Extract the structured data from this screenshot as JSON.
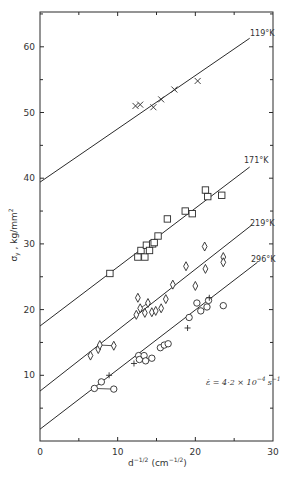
{
  "chart_data": {
    "type": "scatter",
    "title": "",
    "xlabel": "d^-1/2 (cm^-1/2)",
    "ylabel": "σy , kg/mm²",
    "xlim": [
      0,
      30
    ],
    "ylim": [
      0,
      66
    ],
    "x_ticks": [
      0,
      10,
      20,
      30
    ],
    "x_minor_ticks": [
      5,
      15,
      25
    ],
    "y_ticks": [
      10,
      20,
      30,
      40,
      50,
      60
    ],
    "y_minor_ticks": [
      5,
      15,
      25,
      35,
      45,
      55,
      65
    ],
    "grid": false,
    "annotation": "ε̇ = 4·2 × 10⁻⁴ s⁻¹",
    "series": [
      {
        "name": "119°K",
        "marker": "x",
        "fit_line": {
          "x": [
            0,
            27
          ],
          "y": [
            39.4,
            61.3
          ]
        },
        "points": [
          {
            "x": 12.3,
            "y": 51.0
          },
          {
            "x": 12.9,
            "y": 51.2
          },
          {
            "x": 14.6,
            "y": 50.8
          },
          {
            "x": 15.6,
            "y": 52.0
          },
          {
            "x": 17.3,
            "y": 53.5
          },
          {
            "x": 20.3,
            "y": 54.8
          }
        ]
      },
      {
        "name": "171°K",
        "marker": "square",
        "fit_line": {
          "x": [
            0,
            27
          ],
          "y": [
            17.5,
            41.7
          ]
        },
        "points": [
          {
            "x": 9.0,
            "y": 25.5
          },
          {
            "x": 12.6,
            "y": 28.0
          },
          {
            "x": 13.0,
            "y": 29.0
          },
          {
            "x": 13.5,
            "y": 28.0
          },
          {
            "x": 13.7,
            "y": 29.8
          },
          {
            "x": 14.1,
            "y": 29.0
          },
          {
            "x": 14.5,
            "y": 30.0
          },
          {
            "x": 14.7,
            "y": 30.2
          },
          {
            "x": 15.2,
            "y": 31.2
          },
          {
            "x": 16.4,
            "y": 33.8
          },
          {
            "x": 18.7,
            "y": 35.0
          },
          {
            "x": 19.6,
            "y": 34.6
          },
          {
            "x": 21.3,
            "y": 38.2
          },
          {
            "x": 21.6,
            "y": 37.2
          },
          {
            "x": 23.4,
            "y": 37.4
          }
        ]
      },
      {
        "name": "219°K",
        "marker": "diamond",
        "fit_line": {
          "x": [
            0,
            27.3
          ],
          "y": [
            7.6,
            32.9
          ]
        },
        "points": [
          {
            "x": 6.5,
            "y": 13.0
          },
          {
            "x": 7.5,
            "y": 14.0
          },
          {
            "x": 7.7,
            "y": 14.6
          },
          {
            "x": 9.5,
            "y": 14.5
          },
          {
            "x": 12.4,
            "y": 19.2
          },
          {
            "x": 12.6,
            "y": 21.8
          },
          {
            "x": 12.9,
            "y": 20.2
          },
          {
            "x": 13.5,
            "y": 19.5
          },
          {
            "x": 13.9,
            "y": 21.0
          },
          {
            "x": 14.4,
            "y": 19.6
          },
          {
            "x": 14.9,
            "y": 19.8
          },
          {
            "x": 15.6,
            "y": 20.2
          },
          {
            "x": 16.2,
            "y": 21.6
          },
          {
            "x": 17.1,
            "y": 23.8
          },
          {
            "x": 18.8,
            "y": 26.6
          },
          {
            "x": 20.0,
            "y": 23.6
          },
          {
            "x": 21.2,
            "y": 29.6
          },
          {
            "x": 21.3,
            "y": 26.2
          },
          {
            "x": 23.6,
            "y": 28.0
          },
          {
            "x": 23.6,
            "y": 27.2
          }
        ]
      },
      {
        "name": "296°K",
        "marker": "circle",
        "fit_line": {
          "x": [
            0,
            28
          ],
          "y": [
            1.8,
            27.2
          ]
        },
        "points": [
          {
            "x": 7.0,
            "y": 8.0
          },
          {
            "x": 7.9,
            "y": 9.0
          },
          {
            "x": 9.5,
            "y": 7.9
          },
          {
            "x": 12.7,
            "y": 13.0
          },
          {
            "x": 12.8,
            "y": 12.4
          },
          {
            "x": 13.4,
            "y": 13.0
          },
          {
            "x": 13.6,
            "y": 12.2
          },
          {
            "x": 14.4,
            "y": 12.6
          },
          {
            "x": 15.5,
            "y": 14.2
          },
          {
            "x": 16.0,
            "y": 14.6
          },
          {
            "x": 16.5,
            "y": 14.8
          },
          {
            "x": 19.2,
            "y": 18.8
          },
          {
            "x": 20.2,
            "y": 21.0
          },
          {
            "x": 20.7,
            "y": 19.8
          },
          {
            "x": 21.5,
            "y": 20.4
          },
          {
            "x": 21.7,
            "y": 21.4
          },
          {
            "x": 23.6,
            "y": 20.6
          }
        ],
        "plus_points": [
          {
            "x": 8.9,
            "y": 10.0
          },
          {
            "x": 12.1,
            "y": 11.8
          },
          {
            "x": 19.0,
            "y": 17.2
          },
          {
            "x": 21.8,
            "y": 21.8
          }
        ]
      }
    ]
  },
  "labels": {
    "y_axis": "σy , kg/mm²",
    "y_axis_main": "σ",
    "y_axis_sub": "y",
    "y_axis_rest": " , kg/mm",
    "y_axis_sup": "2",
    "x_axis_base": "d",
    "x_axis_sup": "−1/2",
    "x_axis_units": "(cm",
    "x_axis_units_sup": "−1/2",
    "x_axis_close": ")",
    "annotation_main": "ε̇ = 4·2 × 10",
    "annotation_sup": "−4",
    "annotation_tail": "s",
    "annotation_tail_sup": "−1",
    "series_labels": [
      "119°K",
      "171°K",
      "219°K",
      "296°K"
    ],
    "x_tick_labels": [
      "0",
      "10",
      "20",
      "30"
    ],
    "y_tick_labels": [
      "10",
      "20",
      "30",
      "40",
      "50",
      "60"
    ]
  },
  "colors": {
    "ink": "#2a2a2a",
    "background": "#ffffff"
  }
}
